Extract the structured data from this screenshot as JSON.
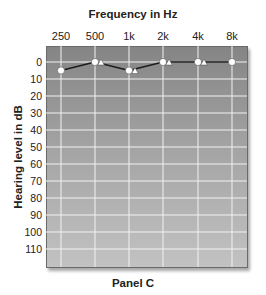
{
  "chart_data": {
    "type": "line",
    "title": "Frequency in Hz",
    "xlabel": "Frequency in Hz",
    "ylabel": "Hearing level in dB",
    "caption": "Panel C",
    "categories": [
      "250",
      "500",
      "1k",
      "2k",
      "4k",
      "8k"
    ],
    "y_ticks": [
      "0",
      "10",
      "20",
      "30",
      "40",
      "50",
      "60",
      "70",
      "80",
      "90",
      "100",
      "110"
    ],
    "ylim": [
      -10,
      120
    ],
    "y_inverted": true,
    "grid": true,
    "series": [
      {
        "name": "Air conduction (circle)",
        "marker": "circle",
        "values": [
          5,
          0,
          5,
          0,
          0,
          0
        ],
        "connected": true
      },
      {
        "name": "Bone conduction (triangle)",
        "marker": "triangle",
        "values": [
          null,
          0,
          5,
          0,
          0,
          null
        ],
        "connected": false
      }
    ]
  },
  "labels": {
    "title": "Frequency in Hz",
    "ylabel": "Hearing level in dB",
    "caption": "Panel C"
  }
}
